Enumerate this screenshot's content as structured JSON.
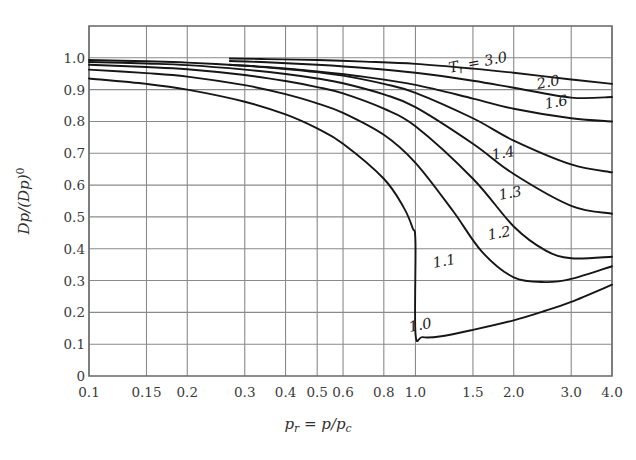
{
  "chart_data": {
    "type": "line",
    "title": "",
    "xlabel": "p_r = p/p_c",
    "xlabel_parts": {
      "var": "p",
      "var_sub": "r",
      "eq": " = ",
      "num": "p",
      "slash": "/",
      "den": "p",
      "den_sub": "c"
    },
    "ylabel": "Dp/(Dp)⁰",
    "ylabel_parts": {
      "a": "Dp",
      "slash": "/",
      "b": "(Dp)",
      "sup": "0"
    },
    "xscale": "log",
    "yscale": "linear",
    "xlim": [
      0.1,
      4.0
    ],
    "ylim": [
      0.0,
      1.1
    ],
    "grid": true,
    "legend": "inline-curve-labels",
    "xticks": [
      0.1,
      0.15,
      0.2,
      0.3,
      0.4,
      0.5,
      0.6,
      0.8,
      1.0,
      1.5,
      2.0,
      3.0,
      4.0
    ],
    "xticklabels": [
      "0.1",
      "0.15",
      "0.2",
      "0.3",
      "0.4",
      "0.5",
      "0.6",
      "0.8",
      "1.0",
      "1.5",
      "2.0",
      "3.0",
      "4.0"
    ],
    "yticks": [
      0,
      0.1,
      0.2,
      0.3,
      0.4,
      0.5,
      0.6,
      0.7,
      0.8,
      0.9,
      1.0
    ],
    "yticklabels": [
      "0",
      "0.1",
      "0.2",
      "0.3",
      "0.4",
      "0.5",
      "0.6",
      "0.7",
      "0.8",
      "0.9",
      "1.0"
    ],
    "series": [
      {
        "name": "Tr = 3.0",
        "label": "T_r = 3.0",
        "label_parts": {
          "var": "T",
          "sub": "r",
          "rest": " = 3.0"
        },
        "x": [
          0.27,
          0.35,
          0.5,
          0.7,
          1.0,
          1.5,
          2.0,
          3.0,
          4.0
        ],
        "y": [
          0.998,
          0.996,
          0.993,
          0.988,
          0.981,
          0.966,
          0.953,
          0.932,
          0.918
        ]
      },
      {
        "name": "Tr = 2.0",
        "label": "2.0",
        "x": [
          0.27,
          0.35,
          0.5,
          0.7,
          1.0,
          1.5,
          2.0,
          3.0,
          4.0
        ],
        "y": [
          0.99,
          0.986,
          0.978,
          0.968,
          0.953,
          0.928,
          0.906,
          0.875,
          0.877
        ]
      },
      {
        "name": "Tr = 1.6",
        "label": "1.6",
        "x": [
          0.27,
          0.35,
          0.5,
          0.7,
          1.0,
          1.5,
          2.0,
          3.0,
          4.0
        ],
        "y": [
          0.978,
          0.971,
          0.957,
          0.94,
          0.915,
          0.872,
          0.84,
          0.81,
          0.8
        ]
      },
      {
        "name": "Tr = 1.4",
        "label": "1.4",
        "x": [
          0.1,
          0.15,
          0.2,
          0.3,
          0.4,
          0.5,
          0.6,
          0.8,
          1.0,
          1.5,
          2.0,
          3.0,
          4.0
        ],
        "y": [
          0.993,
          0.989,
          0.985,
          0.975,
          0.965,
          0.955,
          0.944,
          0.918,
          0.89,
          0.81,
          0.74,
          0.665,
          0.64
        ]
      },
      {
        "name": "Tr = 1.3",
        "label": "1.3",
        "x": [
          0.1,
          0.15,
          0.2,
          0.3,
          0.4,
          0.5,
          0.6,
          0.8,
          1.0,
          1.5,
          2.0,
          3.0,
          4.0
        ],
        "y": [
          0.987,
          0.982,
          0.977,
          0.963,
          0.949,
          0.935,
          0.92,
          0.885,
          0.845,
          0.73,
          0.635,
          0.535,
          0.51
        ]
      },
      {
        "name": "Tr = 1.2",
        "label": "1.2",
        "x": [
          0.1,
          0.15,
          0.2,
          0.3,
          0.4,
          0.5,
          0.6,
          0.8,
          1.0,
          1.5,
          2.0,
          2.5,
          3.0,
          4.0
        ],
        "y": [
          0.978,
          0.971,
          0.964,
          0.946,
          0.927,
          0.908,
          0.888,
          0.84,
          0.785,
          0.62,
          0.47,
          0.395,
          0.37,
          0.375
        ]
      },
      {
        "name": "Tr = 1.1",
        "label": "1.1",
        "x": [
          0.1,
          0.15,
          0.2,
          0.3,
          0.4,
          0.5,
          0.6,
          0.8,
          1.0,
          1.3,
          1.6,
          2.0,
          2.5,
          3.0,
          4.0
        ],
        "y": [
          0.963,
          0.952,
          0.941,
          0.914,
          0.886,
          0.857,
          0.827,
          0.758,
          0.67,
          0.52,
          0.39,
          0.31,
          0.295,
          0.305,
          0.345
        ]
      },
      {
        "name": "Tr = 1.0",
        "label": "1.0",
        "x": [
          0.1,
          0.15,
          0.2,
          0.3,
          0.4,
          0.5,
          0.6,
          0.8,
          0.92,
          0.98,
          1.0,
          1.0,
          1.05,
          1.2,
          1.5,
          2.0,
          2.5,
          3.0,
          4.0
        ],
        "y": [
          0.935,
          0.918,
          0.9,
          0.862,
          0.822,
          0.778,
          0.73,
          0.62,
          0.53,
          0.465,
          0.42,
          0.135,
          0.122,
          0.125,
          0.145,
          0.175,
          0.205,
          0.233,
          0.287
        ]
      }
    ],
    "annotations": [
      {
        "text": "T_r = 3.0",
        "x": 1.55,
        "y": 0.985
      },
      {
        "text": "2.0",
        "x": 2.55,
        "y": 0.925
      },
      {
        "text": "1.6",
        "x": 2.7,
        "y": 0.86
      },
      {
        "text": "1.4",
        "x": 1.85,
        "y": 0.7
      },
      {
        "text": "1.3",
        "x": 1.95,
        "y": 0.575
      },
      {
        "text": "1.2",
        "x": 1.8,
        "y": 0.45
      },
      {
        "text": "1.1",
        "x": 1.22,
        "y": 0.36
      },
      {
        "text": "1.0",
        "x": 1.03,
        "y": 0.16
      }
    ],
    "colors": {
      "background": "#ffffff",
      "grid": "#8a8a8a",
      "axis": "#6e6e6e",
      "curve": "#161616",
      "text": "#3a3a3a"
    }
  }
}
